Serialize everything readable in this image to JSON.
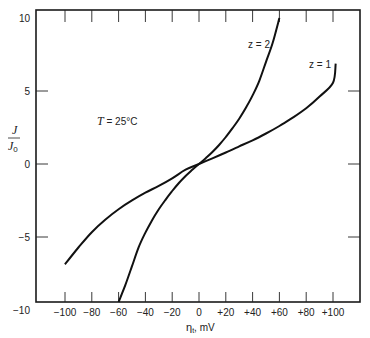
{
  "chart_data": {
    "type": "line",
    "title": "",
    "xlabel": "η_t, mV",
    "xlabel_symbol": "η",
    "xlabel_sub": "t",
    "xlabel_unit": ", mV",
    "ylabel": "J/J0",
    "ylabel_num": "J",
    "ylabel_den": "J",
    "ylabel_den_sub": "0",
    "xlim": [
      -120,
      120
    ],
    "ylim": [
      -10,
      10
    ],
    "grid": false,
    "x_ticks": [
      -100,
      -80,
      -60,
      -40,
      -20,
      0,
      20,
      40,
      60,
      80,
      100
    ],
    "x_tick_labels": [
      "−100",
      "−80",
      "−60",
      "−40",
      "−20",
      "0",
      "+20",
      "+40",
      "+60",
      "+80",
      "+100"
    ],
    "y_ticks": [
      -10,
      -5,
      0,
      5,
      10
    ],
    "y_tick_labels": [
      "−10",
      "−5",
      "0",
      "5",
      "10"
    ],
    "annotations": {
      "temperature": "T = 25°C",
      "temperature_var": "T",
      "temperature_val": " = 25°C"
    },
    "series": [
      {
        "name": "z = 1",
        "label": "z = 1",
        "x": [
          -100,
          -90,
          -80,
          -70,
          -60,
          -50,
          -40,
          -30,
          -20,
          -10,
          0,
          10,
          20,
          30,
          40,
          50,
          60,
          70,
          80,
          90,
          100,
          102
        ],
        "y": [
          -6.87,
          -5.72,
          -4.67,
          -3.82,
          -3.1,
          -2.49,
          -1.96,
          -1.5,
          -0.98,
          -0.39,
          0.0,
          0.39,
          0.79,
          1.21,
          1.62,
          2.09,
          2.6,
          3.18,
          3.82,
          4.62,
          5.56,
          6.87
        ]
      },
      {
        "name": "z = 2",
        "label": "z = 2",
        "x": [
          -60,
          -55,
          -50,
          -45,
          -40,
          -35,
          -30,
          -25,
          -20,
          -15,
          -10,
          -5,
          0,
          5,
          10,
          15,
          20,
          25,
          30,
          35,
          40,
          45,
          50,
          55,
          60
        ],
        "y": [
          -10.0,
          -8.3,
          -7.0,
          -5.7,
          -4.7,
          -3.85,
          -3.1,
          -2.45,
          -1.85,
          -1.3,
          -0.82,
          -0.4,
          0.0,
          0.4,
          0.82,
          1.3,
          1.85,
          2.45,
          3.1,
          3.85,
          4.7,
          5.7,
          7.0,
          8.3,
          10.0
        ]
      }
    ]
  }
}
